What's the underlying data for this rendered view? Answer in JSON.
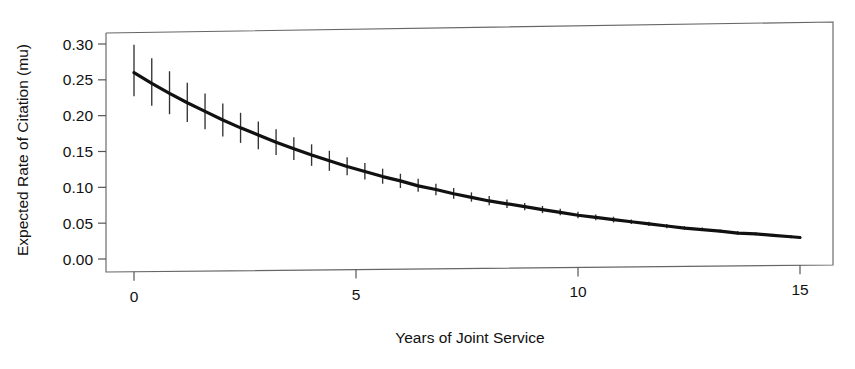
{
  "chart_data": {
    "type": "line",
    "title": "",
    "subtitle": "",
    "xlabel": "Years of Joint Service",
    "ylabel": "Expected Rate of Citation (mu)",
    "xlim": [
      0,
      15
    ],
    "ylim": [
      0.0,
      0.3
    ],
    "xticks": [
      0,
      5,
      10,
      15
    ],
    "xtick_labels": [
      "0",
      "5",
      "10",
      "15"
    ],
    "yticks": [
      0.0,
      0.05,
      0.1,
      0.15,
      0.2,
      0.25,
      0.3
    ],
    "ytick_labels": [
      "0.00",
      "0.05",
      "0.10",
      "0.15",
      "0.20",
      "0.25",
      "0.30"
    ],
    "grid": false,
    "legend": "none",
    "series": [
      {
        "name": "Expected rate of citation",
        "style": "line-with-errorbars",
        "color": "#111111",
        "line_width": 3.2,
        "x": [
          0.0,
          0.4,
          0.8,
          1.2,
          1.6,
          2.0,
          2.4,
          2.8,
          3.2,
          3.6,
          4.0,
          4.4,
          4.8,
          5.2,
          5.6,
          6.0,
          6.4,
          6.8,
          7.2,
          7.6,
          8.0,
          8.4,
          8.8,
          9.2,
          9.6,
          10.0,
          10.4,
          10.8,
          11.2,
          11.6,
          12.0,
          12.4,
          12.8,
          13.2,
          13.6,
          14.0,
          14.4,
          14.8,
          15.0
        ],
        "y": [
          0.26,
          0.245,
          0.231,
          0.218,
          0.206,
          0.194,
          0.183,
          0.173,
          0.163,
          0.154,
          0.145,
          0.137,
          0.129,
          0.122,
          0.115,
          0.109,
          0.102,
          0.097,
          0.091,
          0.086,
          0.081,
          0.077,
          0.073,
          0.069,
          0.065,
          0.061,
          0.058,
          0.055,
          0.052,
          0.049,
          0.046,
          0.043,
          0.041,
          0.039,
          0.036,
          0.035,
          0.033,
          0.031,
          0.03
        ],
        "y_lower": [
          0.227,
          0.214,
          0.202,
          0.191,
          0.181,
          0.171,
          0.162,
          0.153,
          0.145,
          0.138,
          0.13,
          0.123,
          0.117,
          0.111,
          0.105,
          0.099,
          0.094,
          0.089,
          0.084,
          0.08,
          0.075,
          0.071,
          0.068,
          0.064,
          0.061,
          0.057,
          0.054,
          0.051,
          0.049,
          0.046,
          0.043,
          0.041,
          0.039,
          0.037,
          0.034,
          0.033,
          0.031,
          0.029,
          0.029
        ],
        "y_upper": [
          0.299,
          0.28,
          0.262,
          0.246,
          0.231,
          0.217,
          0.204,
          0.192,
          0.181,
          0.17,
          0.16,
          0.151,
          0.142,
          0.134,
          0.126,
          0.119,
          0.112,
          0.105,
          0.099,
          0.093,
          0.088,
          0.083,
          0.078,
          0.074,
          0.07,
          0.066,
          0.062,
          0.059,
          0.055,
          0.052,
          0.049,
          0.046,
          0.044,
          0.041,
          0.039,
          0.037,
          0.035,
          0.033,
          0.032
        ]
      }
    ]
  },
  "axes": {
    "y_title": "Expected Rate of Citation (mu)",
    "x_title": "Years of Joint Service",
    "y_labels": [
      "0.30",
      "0.25",
      "0.20",
      "0.15",
      "0.10",
      "0.05",
      "0.00"
    ],
    "x_labels": [
      "0",
      "5",
      "10",
      "15"
    ]
  },
  "style": {
    "background": "#ffffff",
    "frame_color": "#555555",
    "curve_color": "#111111",
    "errorbar_color": "#333333",
    "text_color": "#111111"
  }
}
